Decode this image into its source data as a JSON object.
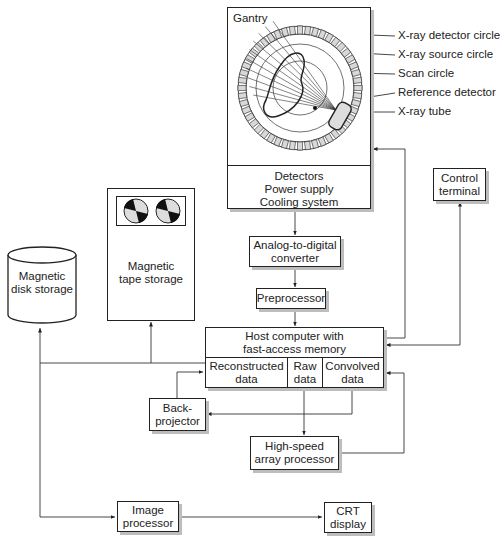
{
  "gantry": {
    "title": "Gantry",
    "subsystems": [
      "Detectors",
      "Power supply",
      "Cooling system"
    ],
    "callouts": [
      "X-ray detector circle",
      "X-ray source circle",
      "Scan circle",
      "Reference detector",
      "X-ray tube"
    ]
  },
  "control_terminal": {
    "lines": [
      "Control",
      "terminal"
    ]
  },
  "tape": {
    "lines": [
      "Magnetic",
      "tape storage"
    ]
  },
  "disk": {
    "lines": [
      "Magnetic",
      "disk storage"
    ]
  },
  "adc": {
    "lines": [
      "Analog-to-digital",
      "converter"
    ]
  },
  "preprocessor": {
    "label": "Preprocessor"
  },
  "host": {
    "lines": [
      "Host computer with",
      "fast-access memory"
    ],
    "cells": [
      {
        "lines": [
          "Reconstructed",
          "data"
        ]
      },
      {
        "lines": [
          "Raw",
          "data"
        ]
      },
      {
        "lines": [
          "Convolved",
          "data"
        ]
      }
    ]
  },
  "backprojector": {
    "lines": [
      "Back-",
      "projector"
    ]
  },
  "array_processor": {
    "lines": [
      "High-speed",
      "array processor"
    ]
  },
  "image_processor": {
    "lines": [
      "Image",
      "processor"
    ]
  },
  "crt": {
    "lines": [
      "CRT",
      "display"
    ]
  },
  "colors": {
    "line": "#222222",
    "shadow": "#bdbdbd",
    "detector_cell": "#d8d8d8"
  }
}
